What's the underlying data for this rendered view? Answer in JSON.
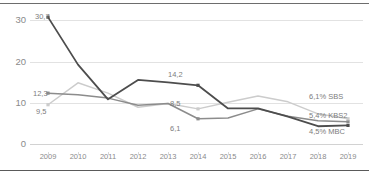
{
  "chart_data": {
    "type": "line",
    "title": "",
    "subtitle": "",
    "xlabel": "",
    "ylabel": "",
    "categories": [
      "2009",
      "2010",
      "2011",
      "2012",
      "2013",
      "2014",
      "2015",
      "2016",
      "2017",
      "2018",
      "2019"
    ],
    "ylim": [
      0,
      33
    ],
    "yticks": [
      "0",
      "10",
      "20",
      "30"
    ],
    "ytick_values": [
      0,
      10,
      20,
      30
    ],
    "grid": true,
    "legend_position": "right-inline",
    "series": [
      {
        "name": "MBC",
        "color": "#4d4d4d",
        "values": [
          30.7,
          19.2,
          10.8,
          15.5,
          14.9,
          14.2,
          8.6,
          8.6,
          6.6,
          4.3,
          4.5
        ],
        "end_label": "4,5% MBC"
      },
      {
        "name": "KBS2",
        "color": "#8c8c8c",
        "values": [
          12.3,
          11.9,
          11.1,
          9.4,
          9.8,
          6.1,
          6.3,
          8.5,
          6.7,
          5.6,
          5.4
        ],
        "end_label": "5,4% KBS2"
      },
      {
        "name": "SBS",
        "color": "#cccccc",
        "values": [
          9.5,
          14.8,
          12.3,
          8.9,
          9.8,
          8.5,
          10.1,
          11.6,
          10.2,
          7.3,
          6.1
        ],
        "end_label": "6,1% SBS"
      }
    ],
    "annotations": [
      {
        "text": "30,7",
        "series": "MBC",
        "x": "2009",
        "value": 30.7
      },
      {
        "text": "12,3",
        "series": "KBS2",
        "x": "2009",
        "value": 12.3
      },
      {
        "text": "9,5",
        "series": "SBS",
        "x": "2009",
        "value": 9.5
      },
      {
        "text": "14,2",
        "series": "MBC",
        "x": "2014",
        "value": 14.2
      },
      {
        "text": "8,5",
        "series": "SBS",
        "x": "2014",
        "value": 8.5
      },
      {
        "text": "6,1",
        "series": "KBS2",
        "x": "2014",
        "value": 6.1
      }
    ]
  },
  "labels": {
    "a0": "30,7",
    "a1": "12,3",
    "a2": "9,5",
    "a3": "14,2",
    "a4": "8,5",
    "a5": "6,1",
    "legend_sbs": "6,1% SBS",
    "legend_kbs2": "5,4% KBS2",
    "legend_mbc": "4,5% MBC"
  },
  "yticks": {
    "t0": "30",
    "t1": "20",
    "t2": "10",
    "t3": "0"
  },
  "xticks": {
    "x0": "2009",
    "x1": "2010",
    "x2": "2011",
    "x3": "2012",
    "x4": "2013",
    "x5": "2014",
    "x6": "2015",
    "x7": "2016",
    "x8": "2017",
    "x9": "2018",
    "x10": "2019"
  }
}
